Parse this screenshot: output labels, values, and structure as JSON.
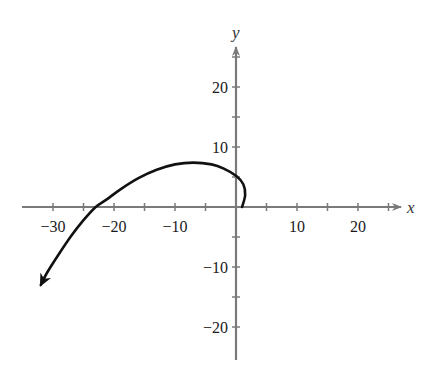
{
  "chart_data": {
    "type": "line",
    "title": "",
    "xlabel": "x",
    "ylabel": "y",
    "xlim": [
      -35,
      27
    ],
    "ylim": [
      -26,
      27
    ],
    "grid": false,
    "x_ticks": [
      -30,
      -25,
      -20,
      -15,
      -10,
      -5,
      5,
      10,
      15,
      20,
      25
    ],
    "x_tick_labels": [
      "-30",
      "-20",
      "-10",
      "10",
      "20"
    ],
    "x_tick_label_values": [
      -30,
      -20,
      -10,
      10,
      20
    ],
    "y_ticks": [
      25,
      20,
      15,
      10,
      5,
      -5,
      -10,
      -15,
      -20
    ],
    "y_tick_labels": [
      "20",
      "10",
      "-10",
      "-20"
    ],
    "y_tick_label_values": [
      20,
      10,
      -10,
      -20
    ],
    "series": [
      {
        "name": "curve",
        "color": "#111111",
        "arrow_end": true,
        "x": [
          1,
          1.5,
          1.2,
          0,
          -2,
          -4,
          -7,
          -10,
          -13,
          -16,
          -19,
          -21,
          -23,
          -25,
          -27,
          -29,
          -31,
          -32
        ],
        "y": [
          0,
          2,
          3.8,
          5.2,
          6.4,
          7.1,
          7.4,
          7.1,
          6.2,
          4.8,
          2.9,
          1.4,
          0,
          -2.2,
          -4.8,
          -7.8,
          -11,
          -13
        ]
      }
    ]
  },
  "labels": {
    "x_axis": "x",
    "y_axis": "y"
  }
}
